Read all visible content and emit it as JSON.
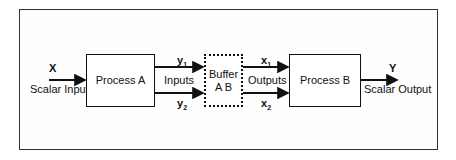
{
  "diagram": {
    "input": {
      "variable": "X",
      "label": "Scalar Input"
    },
    "process_a": {
      "label": "Process A"
    },
    "inputs_label": "Inputs",
    "y1": {
      "base": "y",
      "sub": "1"
    },
    "y2": {
      "base": "y",
      "sub": "2"
    },
    "buffer": {
      "line1": "Buffer",
      "line2": "A B"
    },
    "outputs_label": "Outputs",
    "x1": {
      "base": "x",
      "sub": "1"
    },
    "x2": {
      "base": "x",
      "sub": "2"
    },
    "process_b": {
      "label": "Process B"
    },
    "output": {
      "variable": "Y",
      "label": "Scalar Output"
    }
  }
}
